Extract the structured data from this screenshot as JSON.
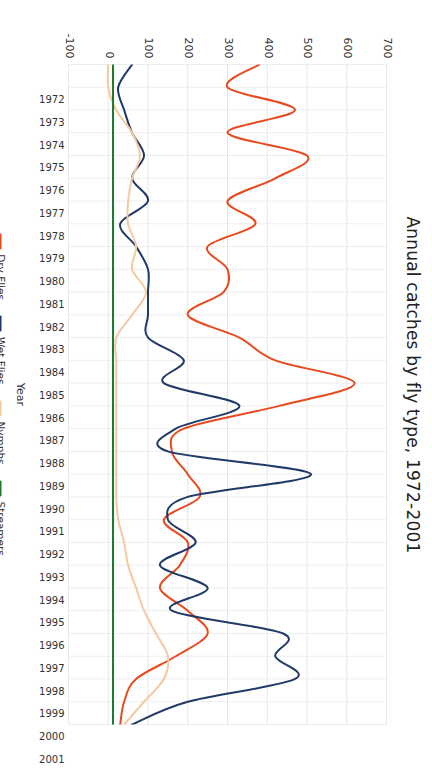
{
  "chart_data": {
    "type": "line",
    "title": "Annual catches by fly type, 1972-2001",
    "xlabel": "Year",
    "ylabel": "Trout Caught",
    "ylim": [
      -100,
      700
    ],
    "yticks": [
      -100,
      0,
      100,
      200,
      300,
      400,
      500,
      600,
      700
    ],
    "grid": true,
    "legend_position": "right",
    "x": [
      1972,
      1973,
      1974,
      1975,
      1976,
      1977,
      1978,
      1979,
      1980,
      1981,
      1982,
      1983,
      1984,
      1985,
      1986,
      1987,
      1988,
      1989,
      1990,
      1991,
      1992,
      1993,
      1994,
      1995,
      1996,
      1997,
      1998,
      1999,
      2000,
      2001
    ],
    "categories": [
      "1972",
      "1973",
      "1974",
      "1975",
      "1976",
      "1977",
      "1978",
      "1979",
      "1980",
      "1981",
      "1982",
      "1983",
      "1984",
      "1985",
      "1986",
      "1987",
      "1988",
      "1989",
      "1990",
      "1991",
      "1992",
      "1993",
      "1994",
      "1995",
      "1996",
      "1997",
      "1998",
      "1999",
      "2000",
      "2001"
    ],
    "series": [
      {
        "name": "Dry Flies",
        "color": "#e8491d",
        "values": [
          380,
          300,
          470,
          300,
          500,
          420,
          300,
          370,
          250,
          300,
          290,
          200,
          330,
          420,
          620,
          430,
          190,
          160,
          200,
          230,
          140,
          200,
          180,
          130,
          200,
          250,
          170,
          70,
          40,
          30
        ]
      },
      {
        "name": "Wet Flies",
        "color": "#1f3a68",
        "values": [
          60,
          25,
          40,
          60,
          90,
          60,
          100,
          30,
          70,
          100,
          100,
          100,
          100,
          190,
          140,
          330,
          170,
          150,
          510,
          200,
          150,
          220,
          130,
          250,
          160,
          440,
          420,
          470,
          200,
          60
        ]
      },
      {
        "name": "Nymphs",
        "color": "#f5c9a0",
        "values": [
          0,
          0,
          20,
          60,
          80,
          60,
          50,
          50,
          70,
          60,
          95,
          60,
          20,
          20,
          20,
          20,
          20,
          20,
          20,
          20,
          25,
          40,
          50,
          70,
          90,
          120,
          150,
          140,
          90,
          40
        ]
      },
      {
        "name": "Streamers",
        "color": "#1a7a2e",
        "values": [
          12,
          12,
          12,
          12,
          12,
          12,
          12,
          12,
          12,
          12,
          12,
          12,
          12,
          12,
          12,
          12,
          12,
          12,
          12,
          12,
          12,
          12,
          12,
          12,
          12,
          12,
          12,
          12,
          12,
          12
        ]
      }
    ]
  }
}
